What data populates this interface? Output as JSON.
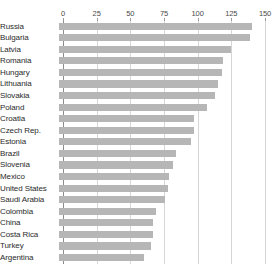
{
  "chart_data": {
    "type": "bar",
    "orientation": "horizontal",
    "title": "",
    "xlabel": "",
    "ylabel": "",
    "xlim": [
      0,
      150
    ],
    "xticks": [
      0,
      25,
      50,
      75,
      100,
      125,
      150
    ],
    "xtick_labels": [
      "0",
      "25",
      "50",
      "75",
      "100",
      "125",
      "150"
    ],
    "grid": true,
    "legend": "none",
    "bar_color": "#b6b6b6",
    "categories": [
      "Russia",
      "Bulgaria",
      "Latvia",
      "Romania",
      "Hungary",
      "Lithuania",
      "Slovakia",
      "Poland",
      "Croatia",
      "Czech Rep.",
      "Estonia",
      "Brazil",
      "Slovenia",
      "Mexico",
      "United States",
      "Saudi Arabia",
      "Colombia",
      "China",
      "Costa Rica",
      "Turkey",
      "Argentina"
    ],
    "values": [
      143,
      142,
      128,
      122,
      121,
      118,
      116,
      110,
      100,
      100,
      98,
      87,
      85,
      82,
      81,
      79,
      72,
      70,
      70,
      68,
      63
    ]
  }
}
